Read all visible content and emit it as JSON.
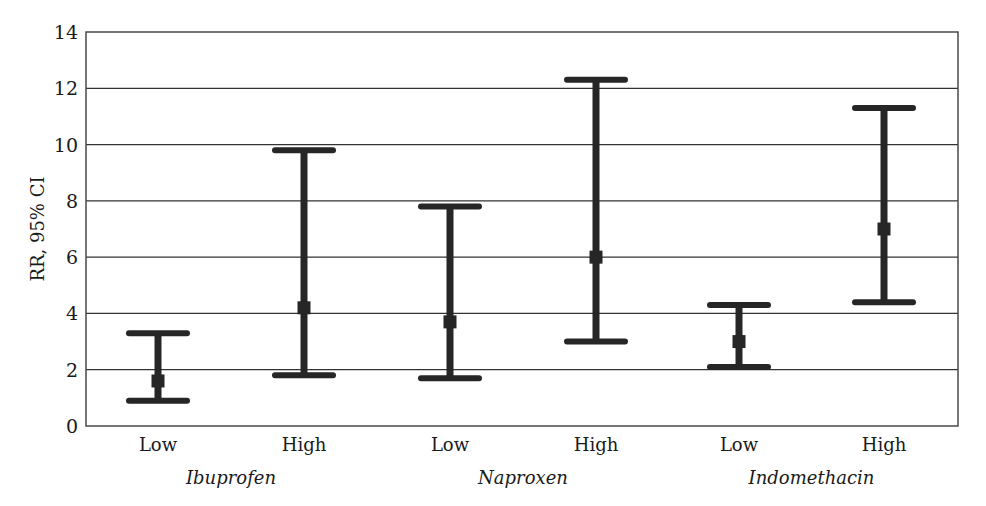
{
  "chart_data": {
    "type": "errorbar",
    "title": "",
    "xlabel": "",
    "ylabel": "RR, 95% CI",
    "ylim": [
      0,
      14
    ],
    "yticks": [
      0,
      2,
      4,
      6,
      8,
      10,
      12,
      14
    ],
    "grid": true,
    "legend": null,
    "groups": [
      {
        "name": "Ibuprofen",
        "categories": [
          {
            "label": "Low",
            "point": 1.6,
            "lower": 0.9,
            "upper": 3.3
          },
          {
            "label": "High",
            "point": 4.2,
            "lower": 1.8,
            "upper": 9.8
          }
        ]
      },
      {
        "name": "Naproxen",
        "categories": [
          {
            "label": "Low",
            "point": 3.7,
            "lower": 1.7,
            "upper": 7.8
          },
          {
            "label": "High",
            "point": 6.0,
            "lower": 3.0,
            "upper": 12.3
          }
        ]
      },
      {
        "name": "Indomethacin",
        "categories": [
          {
            "label": "Low",
            "point": 3.0,
            "lower": 2.1,
            "upper": 4.3
          },
          {
            "label": "High",
            "point": 7.0,
            "lower": 4.4,
            "upper": 11.3
          }
        ]
      }
    ]
  },
  "colors": {
    "bar": "#262626",
    "grid": "#333333",
    "frame": "#4a4a4a",
    "text": "#1a1a1a"
  }
}
